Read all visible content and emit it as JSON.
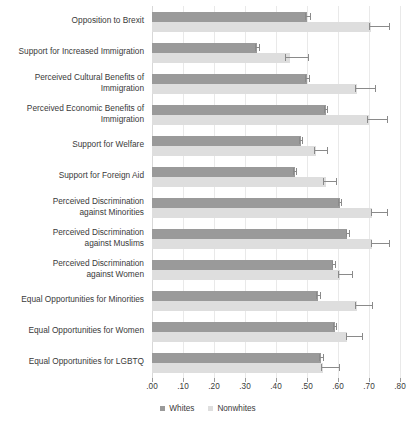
{
  "chart_data": {
    "type": "bar",
    "orientation": "horizontal",
    "title": "",
    "subtitle": "",
    "xlabel": "",
    "ylabel": "",
    "xlim": [
      0.0,
      0.8
    ],
    "xticks": [
      0.0,
      0.1,
      0.2,
      0.3,
      0.4,
      0.5,
      0.6,
      0.7,
      0.8
    ],
    "xticklabels": [
      ".00",
      ".10",
      ".20",
      ".30",
      ".40",
      ".50",
      ".60",
      ".70",
      ".80"
    ],
    "grid": true,
    "grid_axis": "x",
    "legend_position": "bottom",
    "categories": [
      "Opposition to Brexit",
      "Support for Increased Immigration",
      "Perceived Cultural Benefits of\nImmigration",
      "Perceived Economic Benefits of\nImmigration",
      "Support for Welfare",
      "Support for Foreign Aid",
      "Perceived Discrimination\nagainst Minorities",
      "Perceived Discrimination\nagainst Muslims",
      "Perceived Discrimination\nagainst Women",
      "Equal Opportunities for Minorities",
      "Equal Opportunities for Women",
      "Equal Opportunities for LGBTQ"
    ],
    "series": [
      {
        "name": "Whites",
        "color": "#9a9a9a",
        "values": [
          0.5,
          0.34,
          0.5,
          0.56,
          0.48,
          0.46,
          0.605,
          0.63,
          0.585,
          0.535,
          0.59,
          0.545
        ],
        "ci_low": [
          0.495,
          0.333,
          0.495,
          0.555,
          0.474,
          0.455,
          0.6,
          0.625,
          0.58,
          0.53,
          0.585,
          0.54
        ],
        "ci_high": [
          0.512,
          0.348,
          0.51,
          0.568,
          0.488,
          0.468,
          0.613,
          0.64,
          0.595,
          0.545,
          0.598,
          0.556
        ]
      },
      {
        "name": "Nonwhites",
        "color": "#dedede",
        "values": [
          0.705,
          0.445,
          0.66,
          0.7,
          0.53,
          0.56,
          0.71,
          0.71,
          0.605,
          0.66,
          0.63,
          0.55
        ],
        "ci_low": [
          0.7,
          0.43,
          0.655,
          0.695,
          0.523,
          0.552,
          0.705,
          0.705,
          0.6,
          0.655,
          0.625,
          0.545
        ],
        "ci_high": [
          0.768,
          0.508,
          0.722,
          0.76,
          0.568,
          0.598,
          0.762,
          0.768,
          0.648,
          0.712,
          0.68,
          0.605
        ]
      }
    ]
  },
  "legend": {
    "items": [
      {
        "label": "Whites",
        "color": "#9a9a9a"
      },
      {
        "label": "Nonwhites",
        "color": "#dedede"
      }
    ]
  }
}
